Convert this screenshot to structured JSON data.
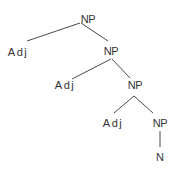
{
  "diagram": {
    "type": "syntax-tree",
    "nodes": [
      {
        "id": "np1",
        "label": "NP",
        "x": 88,
        "y": 19
      },
      {
        "id": "adj1",
        "label": "Adj",
        "x": 18,
        "y": 52
      },
      {
        "id": "np2",
        "label": "NP",
        "x": 111,
        "y": 51
      },
      {
        "id": "adj2",
        "label": "Adj",
        "x": 65,
        "y": 85
      },
      {
        "id": "np3",
        "label": "NP",
        "x": 135,
        "y": 85
      },
      {
        "id": "adj3",
        "label": "Adj",
        "x": 113,
        "y": 123
      },
      {
        "id": "np4",
        "label": "NP",
        "x": 160,
        "y": 123
      },
      {
        "id": "n1",
        "label": "N",
        "x": 160,
        "y": 157
      }
    ],
    "edges": [
      {
        "from": "np1",
        "to": "adj1"
      },
      {
        "from": "np1",
        "to": "np2"
      },
      {
        "from": "np2",
        "to": "adj2"
      },
      {
        "from": "np2",
        "to": "np3"
      },
      {
        "from": "np3",
        "to": "adj3"
      },
      {
        "from": "np3",
        "to": "np4"
      },
      {
        "from": "np4",
        "to": "n1"
      }
    ],
    "colors": {
      "line": "#4a4a4a",
      "text": "#333333",
      "background": "#ffffff"
    }
  }
}
